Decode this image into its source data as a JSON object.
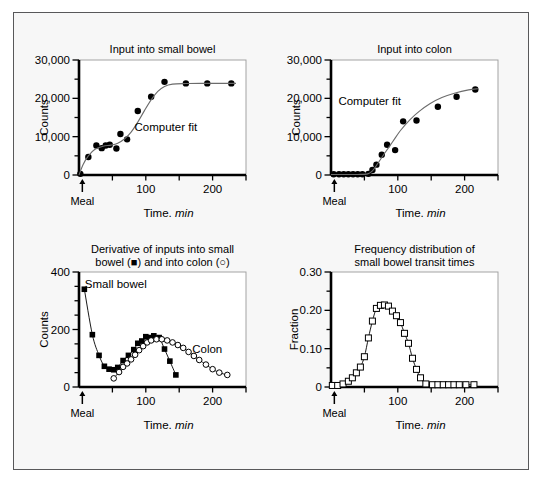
{
  "figure": {
    "background": "#f7f7f7",
    "border_color": "#58585a",
    "panel_count": 4
  },
  "common": {
    "xlabel_text": "Time,",
    "xlabel_italic": "min",
    "meal_label": "Meal",
    "meal_marker": "arrow-up"
  },
  "chart_data": [
    {
      "id": "input-small-bowel",
      "type": "scatter",
      "title": "Input into small bowel",
      "xlabel": "Time, min",
      "ylabel": "Counts",
      "xlim": [
        0,
        250
      ],
      "ylim": [
        0,
        30000
      ],
      "xticks": [
        0,
        50,
        100,
        150,
        200,
        250
      ],
      "xticklabels": [
        "",
        "",
        "100",
        "",
        "200",
        ""
      ],
      "yticks": [
        0,
        5000,
        10000,
        15000,
        20000,
        25000,
        30000
      ],
      "yticklabels": [
        "0",
        "",
        "10,000",
        "",
        "20,000",
        "",
        "30,000"
      ],
      "grid": false,
      "annotations": [
        {
          "text": "Computer fit",
          "x": 130,
          "y": 11500
        },
        {
          "text": "Meal",
          "x": 5,
          "y": 0
        }
      ],
      "series": [
        {
          "name": "Observed counts",
          "marker": "filled-circle",
          "x": [
            2,
            14,
            26,
            34,
            40,
            46,
            56,
            62,
            72,
            88,
            108,
            128,
            160,
            192,
            228
          ],
          "y": [
            300,
            4700,
            7700,
            7000,
            7700,
            7900,
            6900,
            10700,
            9300,
            16700,
            20400,
            24300,
            23900,
            23900,
            23900
          ]
        },
        {
          "name": "Computer fit",
          "marker": "line",
          "x": [
            0,
            6,
            14,
            24,
            36,
            48,
            58,
            68,
            78,
            88,
            98,
            108,
            118,
            128,
            140,
            160,
            185,
            210,
            235
          ],
          "y": [
            0,
            2700,
            5000,
            6700,
            7500,
            7800,
            8300,
            9400,
            11200,
            13800,
            16800,
            19600,
            21800,
            23100,
            23700,
            23850,
            23900,
            23900,
            23900
          ]
        }
      ]
    },
    {
      "id": "input-colon",
      "type": "scatter",
      "title": "Input into colon",
      "xlabel": "Time, min",
      "ylabel": "Counts",
      "xlim": [
        0,
        250
      ],
      "ylim": [
        0,
        30000
      ],
      "xticks": [
        0,
        50,
        100,
        150,
        200,
        250
      ],
      "xticklabels": [
        "",
        "",
        "100",
        "",
        "200",
        ""
      ],
      "yticks": [
        0,
        5000,
        10000,
        15000,
        20000,
        25000,
        30000
      ],
      "yticklabels": [
        "0",
        "",
        "10,000",
        "",
        "20,000",
        "",
        "30,000"
      ],
      "grid": false,
      "annotations": [
        {
          "text": "Computer fit",
          "x": 58,
          "y": 18200
        },
        {
          "text": "Meal",
          "x": 5,
          "y": 0
        }
      ],
      "series": [
        {
          "name": "Observed counts",
          "marker": "filled-circle",
          "x": [
            4,
            12,
            19,
            26,
            33,
            40,
            47,
            56,
            62,
            68,
            76,
            84,
            96,
            108,
            128,
            160,
            188,
            216
          ],
          "y": [
            200,
            200,
            200,
            200,
            200,
            200,
            200,
            300,
            1300,
            2700,
            5300,
            7900,
            6500,
            14000,
            14200,
            17800,
            20400,
            22300
          ]
        },
        {
          "name": "Computer fit",
          "marker": "line",
          "x": [
            0,
            20,
            40,
            55,
            62,
            70,
            80,
            92,
            104,
            118,
            132,
            148,
            166,
            186,
            206,
            220
          ],
          "y": [
            150,
            150,
            150,
            300,
            1100,
            3000,
            5600,
            8600,
            11600,
            14400,
            16600,
            18600,
            20200,
            21400,
            22200,
            22500
          ]
        }
      ]
    },
    {
      "id": "derivative-inputs",
      "type": "line",
      "title_line1": "Derivative of inputs into small",
      "title_line2": "bowel (■) and into colon (○)",
      "title": "Derivative of inputs into small bowel (■) and into colon (○)",
      "xlabel": "Time, min",
      "ylabel": "Counts",
      "xlim": [
        0,
        250
      ],
      "ylim": [
        0,
        400
      ],
      "xticks": [
        0,
        50,
        100,
        150,
        200,
        250
      ],
      "xticklabels": [
        "",
        "",
        "100",
        "",
        "200",
        ""
      ],
      "yticks": [
        0,
        50,
        100,
        150,
        200,
        250,
        300,
        350,
        400
      ],
      "yticklabels": [
        "0",
        "",
        "",
        "",
        "200",
        "",
        "",
        "",
        "400"
      ],
      "grid": false,
      "annotations": [
        {
          "text": "Small bowel",
          "x": 55,
          "y": 345
        },
        {
          "text": "Colon",
          "x": 192,
          "y": 118
        },
        {
          "text": "Meal",
          "x": 5,
          "y": 0
        }
      ],
      "series": [
        {
          "name": "Small bowel",
          "marker": "filled-square",
          "x": [
            8,
            20,
            30,
            38,
            45,
            52,
            58,
            66,
            74,
            82,
            88,
            94,
            100,
            106,
            112,
            120,
            128,
            136,
            145
          ],
          "y": [
            340,
            182,
            110,
            72,
            62,
            60,
            68,
            92,
            110,
            130,
            152,
            160,
            175,
            172,
            178,
            172,
            132,
            90,
            42
          ]
        },
        {
          "name": "Colon",
          "marker": "open-circle",
          "x": [
            52,
            60,
            66,
            72,
            78,
            84,
            90,
            96,
            102,
            108,
            116,
            124,
            132,
            140,
            148,
            156,
            164,
            172,
            180,
            190,
            200,
            210,
            222
          ],
          "y": [
            30,
            52,
            70,
            82,
            96,
            112,
            128,
            142,
            155,
            162,
            166,
            166,
            162,
            155,
            146,
            136,
            122,
            108,
            94,
            78,
            62,
            50,
            42
          ]
        }
      ]
    },
    {
      "id": "frequency-distribution",
      "type": "line",
      "title_line1": "Frequency distribution of",
      "title_line2": "small bowel transit times",
      "title": "Frequency distribution of small bowel transit times",
      "xlabel": "Time, min",
      "ylabel": "Fraction",
      "xlim": [
        0,
        250
      ],
      "ylim": [
        0,
        0.3
      ],
      "xticks": [
        0,
        50,
        100,
        150,
        200,
        250
      ],
      "xticklabels": [
        "",
        "",
        "100",
        "",
        "200",
        ""
      ],
      "yticks": [
        0,
        0.05,
        0.1,
        0.15,
        0.2,
        0.25,
        0.3
      ],
      "yticklabels": [
        "0",
        "",
        "0.10",
        "",
        "0.20",
        "",
        "0.30"
      ],
      "grid": false,
      "annotations": [
        {
          "text": "Meal",
          "x": 5,
          "y": 0
        }
      ],
      "series": [
        {
          "name": "Fraction of transit times",
          "marker": "open-square",
          "x": [
            2,
            10,
            18,
            26,
            32,
            38,
            44,
            50,
            56,
            62,
            68,
            74,
            80,
            86,
            92,
            98,
            104,
            110,
            116,
            122,
            128,
            134,
            142,
            152,
            160,
            168,
            176,
            184,
            192,
            202,
            214
          ],
          "y": [
            0.004,
            0.004,
            0.008,
            0.015,
            0.024,
            0.037,
            0.052,
            0.079,
            0.128,
            0.172,
            0.205,
            0.213,
            0.214,
            0.211,
            0.198,
            0.186,
            0.168,
            0.14,
            0.114,
            0.075,
            0.046,
            0.024,
            0.008,
            0.006,
            0.006,
            0.006,
            0.006,
            0.006,
            0.006,
            0.006,
            0.006
          ]
        }
      ]
    }
  ]
}
